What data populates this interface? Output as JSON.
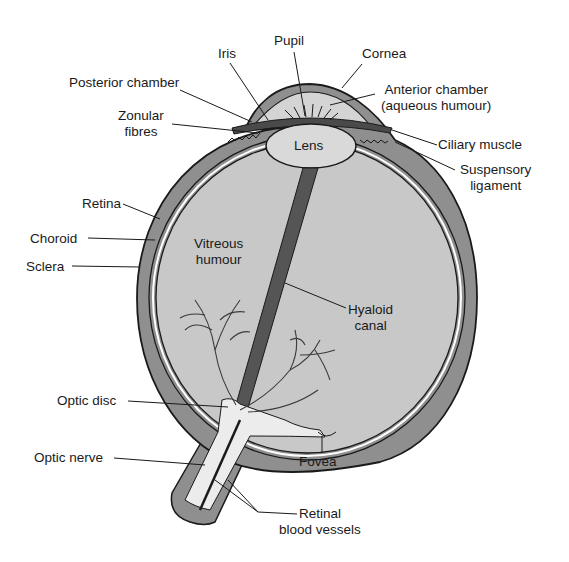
{
  "colors": {
    "sclera": "#8f8f8f",
    "vitreous": "#c8c8c8",
    "aqueous": "#d4d4d4",
    "lens": "#d9d9d9",
    "hyaloid": "#555555",
    "nerve": "#ececec",
    "outline": "#1a1a1a",
    "vessels": "#3a3a3a"
  },
  "labels": {
    "iris": "Iris",
    "pupil": "Pupil",
    "cornea": "Cornea",
    "posterior_chamber": "Posterior chamber",
    "anterior_chamber_1": "Anterior chamber",
    "anterior_chamber_2": "(aqueous humour)",
    "zonular_1": "Zonular",
    "zonular_2": "fibres",
    "ciliary_muscle": "Ciliary muscle",
    "suspensory_1": "Suspensory",
    "suspensory_2": "ligament",
    "lens": "Lens",
    "retina": "Retina",
    "choroid": "Choroid",
    "sclera": "Sclera",
    "vitreous_1": "Vitreous",
    "vitreous_2": "humour",
    "hyaloid_1": "Hyaloid",
    "hyaloid_2": "canal",
    "optic_disc": "Optic disc",
    "optic_nerve": "Optic nerve",
    "fovea": "Fovea",
    "retinal_1": "Retinal",
    "retinal_2": "blood vessels"
  }
}
